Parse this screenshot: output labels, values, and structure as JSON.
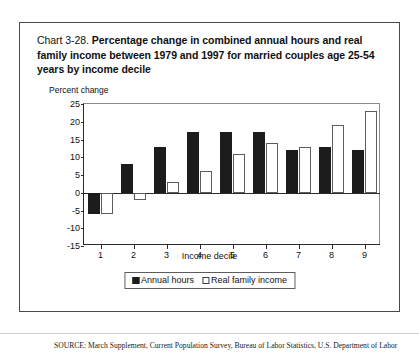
{
  "title": {
    "chart_number": "Chart 3-28.",
    "text": " Percentage change in combined annual hours and real family income between 1979 and 1997 for married couples age 25-54 years by income decile"
  },
  "axis": {
    "ylabel": "Percent change",
    "xlabel": "Income decile",
    "yticks": [
      "25",
      "20",
      "15",
      "10",
      "5",
      "0",
      "-5",
      "-10",
      "-15"
    ],
    "xticks": [
      "1",
      "2",
      "3",
      "4",
      "5",
      "6",
      "7",
      "8",
      "9"
    ]
  },
  "legend": {
    "items": [
      {
        "label": "Annual hours",
        "swatch": "black-square-icon",
        "color": "#1c1c1c"
      },
      {
        "label": "Real family income",
        "swatch": "white-square-icon",
        "color": "#ffffff"
      }
    ]
  },
  "source": "SOURCE: March Supplement, Current Population Survey, Bureau of Labor Statistics, U.S. Department of Labor",
  "chart_data": {
    "type": "bar",
    "title": "Chart 3-28. Percentage change in combined annual hours and real family income between 1979 and 1997 for married couples age 25-54 years by income decile",
    "xlabel": "Income decile",
    "ylabel": "Percent change",
    "ylim": [
      -15,
      25
    ],
    "ytick_step": 5,
    "grid": false,
    "legend_position": "bottom-center",
    "categories": [
      "1",
      "2",
      "3",
      "4",
      "5",
      "6",
      "7",
      "8",
      "9"
    ],
    "series": [
      {
        "name": "Annual hours",
        "color": "#1c1c1c",
        "values": [
          -6,
          8,
          13,
          17,
          17,
          17,
          12,
          13,
          12
        ]
      },
      {
        "name": "Real family income",
        "color": "#ffffff",
        "values": [
          -6,
          -2,
          3,
          6,
          11,
          14,
          13,
          19,
          23
        ]
      }
    ]
  }
}
